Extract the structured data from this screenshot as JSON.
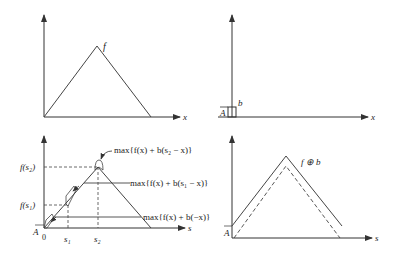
{
  "panels": {
    "top_left": {
      "func_label": "f",
      "x_axis_label": "x"
    },
    "top_right": {
      "bar_label": "b",
      "height_label": "A",
      "x_axis_label": "x"
    },
    "bottom_left": {
      "y_labels": {
        "f_s2": "f(s₂)",
        "f_s1": "f(s₁)",
        "A": "A"
      },
      "x_ticks": {
        "zero": "0",
        "s1": "s₁",
        "s2": "s₂"
      },
      "x_axis_label": "s",
      "annotations": {
        "s2": "max{f(x) + b(s₂ − x)}",
        "s1": "max{f(x) + b(s₁ − x)}",
        "zero": "max{f(x) + b(−x)}"
      }
    },
    "bottom_right": {
      "func_label": "f ⊕ b",
      "height_label": "A",
      "x_axis_label": "s"
    }
  },
  "colors": {
    "line": "#333333",
    "background": "#ffffff"
  }
}
